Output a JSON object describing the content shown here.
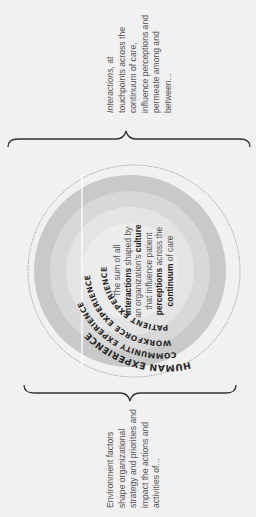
{
  "diagram": {
    "orientation": "rotated 90deg counter-clockwise",
    "left_text": "Environment factors shape organizational strategy and priorities and impact the actions and activities of...",
    "right_text_prefix": "Interactions",
    "right_text": "Interactions, at touchpoints across the continuum of care, influence perceptions and permeate among and between...",
    "rings": [
      {
        "label": "HUMAN EXPERIENCE",
        "color": "#f1f1f1",
        "style": "dotted outline"
      },
      {
        "label": "COMMUNITY EXPERIENCE",
        "color": "#c9c9c9"
      },
      {
        "label": "WORKFORCE EXPERIENCE",
        "color": "#d9d9d9"
      },
      {
        "label": "PATIENT EXPERIENCE",
        "color": "#e6e6e6"
      }
    ],
    "center": {
      "line1_a": "The sum of all",
      "line2_bold": "interactions",
      "line2_rest": " shaped by",
      "line3_a": "an organization's ",
      "line3_bold": "culture",
      "line4": "that influence patient",
      "line5_bold": "perceptions",
      "line5_rest": " across the",
      "line6_bold": "continuum",
      "line6_rest": " of care",
      "core_color": "#ededed"
    }
  }
}
